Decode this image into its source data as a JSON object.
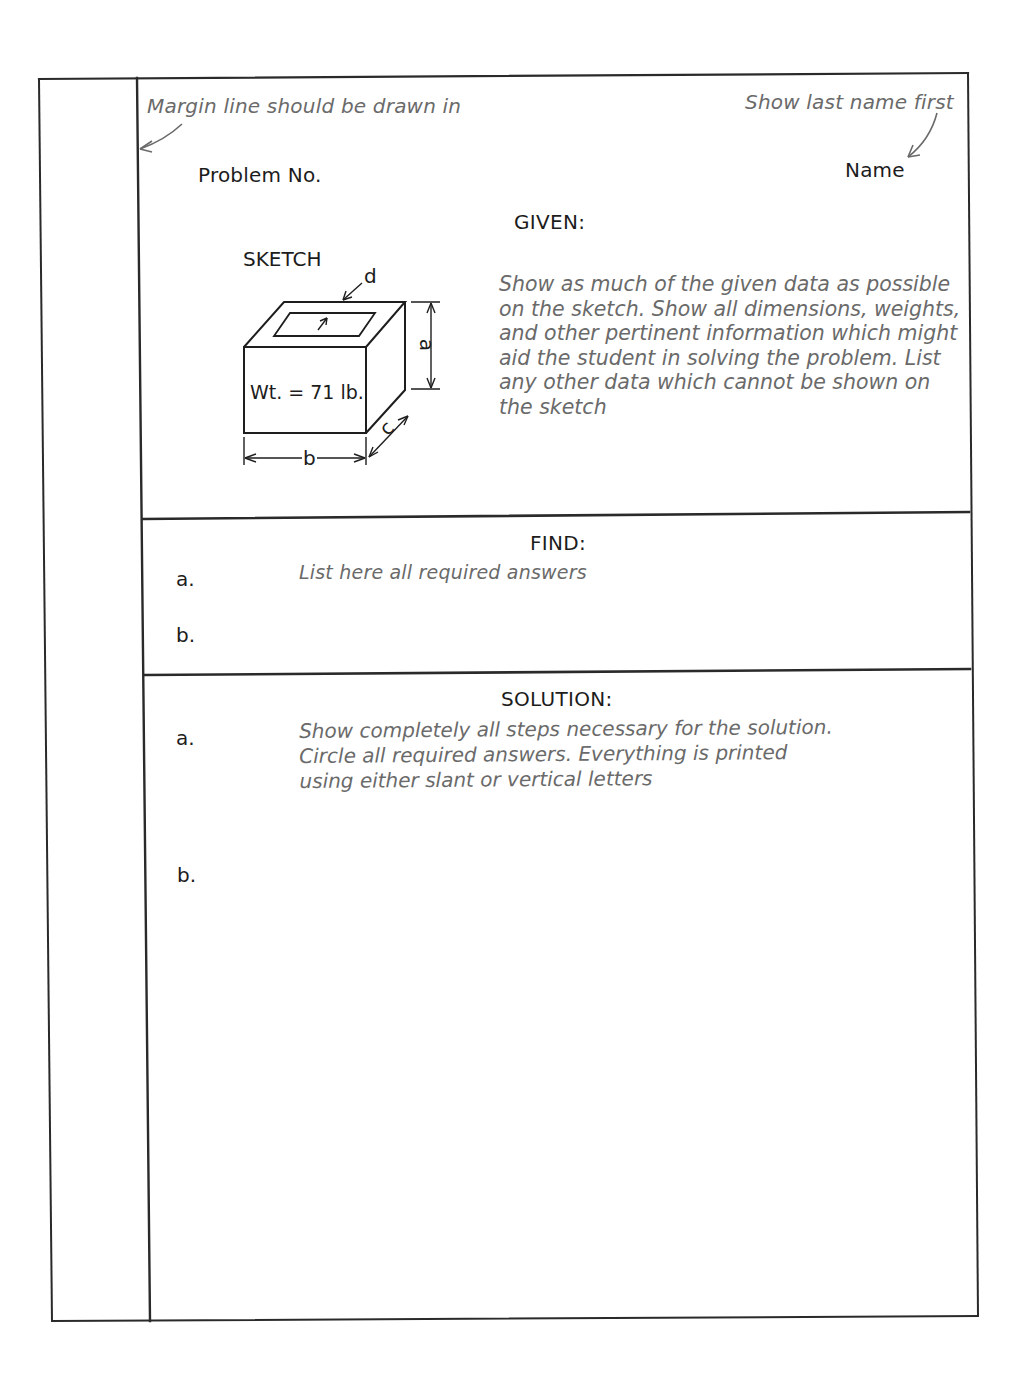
{
  "header": {
    "margin_note": "Margin line should be drawn in",
    "name_note": "Show last name first",
    "problem_label": "Problem No.",
    "name_label": "Name"
  },
  "given": {
    "heading": "GIVEN:",
    "sketch_label": "SKETCH",
    "sketch": {
      "weight_label": "Wt. = 71 lb.",
      "dimensions": {
        "a": "a",
        "b": "b",
        "c": "c",
        "d": "d"
      }
    },
    "instructions": [
      "Show as much of the given data as possible",
      "on the sketch. Show all dimensions, weights,",
      "and other pertinent information which might",
      "aid the student in solving the problem. List",
      "any other data which cannot be shown on",
      "the sketch"
    ]
  },
  "find": {
    "heading": "FIND:",
    "items": [
      {
        "label": "a.",
        "text": "List here all required answers"
      },
      {
        "label": "b.",
        "text": ""
      }
    ]
  },
  "solution": {
    "heading": "SOLUTION:",
    "items": [
      {
        "label": "a."
      },
      {
        "label": "b."
      }
    ],
    "instructions": [
      "Show completely all steps necessary for the solution.",
      "Circle all required answers. Everything is printed",
      "using either slant or vertical letters"
    ]
  },
  "colors": {
    "ink": "#1c1c1c",
    "note_gray": "#6a6a6a",
    "rule": "#2a2a2a"
  }
}
